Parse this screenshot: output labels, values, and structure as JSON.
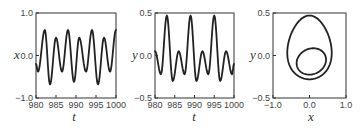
{
  "chart_data": [
    {
      "type": "line",
      "title": "",
      "xlabel": "t",
      "ylabel": "x",
      "xlim": [
        980,
        1000
      ],
      "ylim": [
        -1.0,
        1.0
      ],
      "xticks": [
        "980",
        "985",
        "990",
        "995",
        "1000"
      ],
      "yticks": [
        "−1.0",
        "0.0",
        "1.0"
      ],
      "grid": false,
      "series": [
        {
          "name": "x(t)",
          "t": [
            980,
            980.5,
            982.2,
            983.5,
            985,
            986.5,
            988,
            989.5,
            990.8,
            992.5,
            994,
            995.5,
            997,
            998.5,
            1000
          ],
          "values": [
            -0.2,
            -0.38,
            0.6,
            -0.68,
            0.42,
            -0.38,
            0.6,
            -0.62,
            0.42,
            -0.38,
            0.6,
            -0.68,
            0.42,
            -0.38,
            0.6
          ]
        }
      ]
    },
    {
      "type": "line",
      "title": "",
      "xlabel": "t",
      "ylabel": "y",
      "xlim": [
        980,
        1000
      ],
      "ylim": [
        -0.5,
        0.5
      ],
      "xticks": [
        "980",
        "985",
        "990",
        "995",
        "1000"
      ],
      "yticks": [
        "−0.5",
        "0.0",
        "0.5"
      ],
      "grid": false,
      "series": [
        {
          "name": "y(t)",
          "t": [
            980,
            981.5,
            983,
            984.5,
            986,
            987.5,
            989,
            990.5,
            992,
            993.5,
            995,
            996.5,
            998,
            999.5,
            1000
          ],
          "values": [
            0.05,
            -0.22,
            0.47,
            -0.3,
            0.05,
            -0.22,
            0.47,
            -0.3,
            0.05,
            -0.22,
            0.47,
            -0.3,
            0.05,
            -0.22,
            -0.1
          ]
        }
      ]
    },
    {
      "type": "line",
      "title": "",
      "xlabel": "x",
      "ylabel": "y",
      "xlim": [
        -1.0,
        1.0
      ],
      "ylim": [
        -0.5,
        0.5
      ],
      "xticks": [
        "−1.0",
        "0.0",
        "1.0"
      ],
      "yticks": [
        "−0.5",
        "0.0",
        "0.5"
      ],
      "grid": false,
      "series": [
        {
          "name": "phase portrait (x, y)",
          "outer_loop": {
            "x_range": [
              -0.6,
              0.6
            ],
            "y_range": [
              -0.28,
              0.47
            ]
          },
          "inner_loop": {
            "x_range": [
              -0.35,
              0.45
            ],
            "y_range": [
              -0.22,
              0.08
            ]
          }
        }
      ]
    }
  ]
}
